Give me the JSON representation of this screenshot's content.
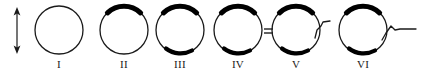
{
  "figure": {
    "kind": "schematic-diagram",
    "width": 423,
    "height": 76,
    "background_color": "#ffffff",
    "stroke_color": "#1a1a1a",
    "cap_fill_color": "#000000"
  },
  "scale_arrow": {
    "name": "vertical-double-headed-arrow",
    "orientation": "vertical",
    "heads": "both",
    "x": 17,
    "y_top": 8,
    "y_bottom": 53,
    "color": "#1a1a1a"
  },
  "stages": [
    {
      "id": "I",
      "label": "I",
      "cx": 59,
      "cy": 30,
      "r": 24,
      "top_cap": false,
      "bottom_cap": false,
      "equals_mark": false,
      "tail": "none"
    },
    {
      "id": "II",
      "label": "II",
      "cx": 124,
      "cy": 30,
      "r": 24,
      "top_cap": true,
      "bottom_cap": false,
      "equals_mark": false,
      "tail": "none"
    },
    {
      "id": "III",
      "label": "III",
      "cx": 180,
      "cy": 30,
      "r": 24,
      "top_cap": true,
      "bottom_cap": true,
      "equals_mark": false,
      "tail": "none"
    },
    {
      "id": "IV",
      "label": "IV",
      "cx": 238,
      "cy": 30,
      "r": 24,
      "top_cap": true,
      "bottom_cap": true,
      "equals_mark": true,
      "tail": "none"
    },
    {
      "id": "V",
      "label": "V",
      "cx": 296,
      "cy": 30,
      "r": 24,
      "top_cap": true,
      "bottom_cap": true,
      "equals_mark": false,
      "tail": "short-zigzag"
    },
    {
      "id": "VI",
      "label": "VI",
      "cx": 363,
      "cy": 30,
      "r": 24,
      "top_cap": true,
      "bottom_cap": true,
      "equals_mark": false,
      "tail": "long-zigzag"
    }
  ],
  "labels_row": {
    "y": 58,
    "font_size_px": 11
  }
}
